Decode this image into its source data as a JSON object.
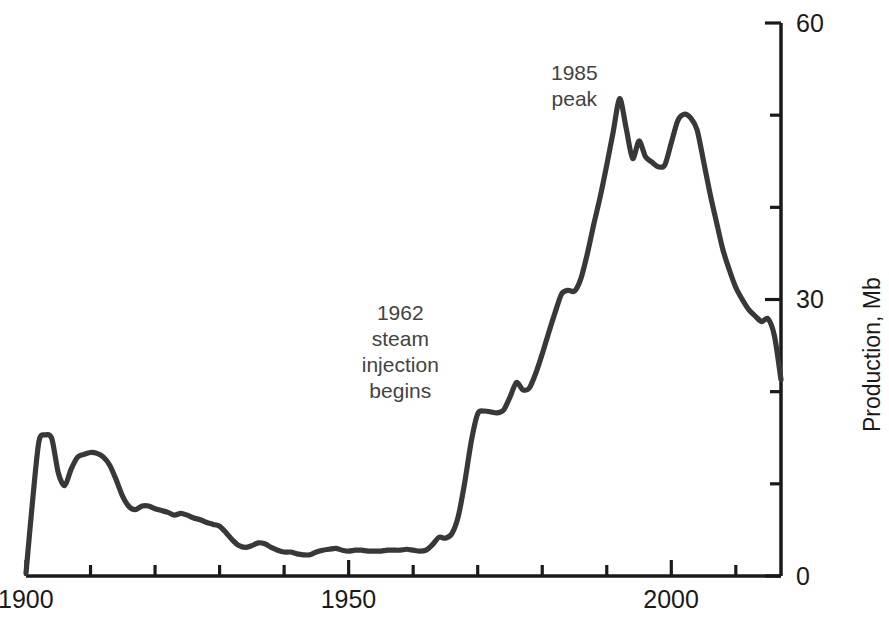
{
  "chart_data": {
    "type": "line",
    "title": "",
    "subtitle": "",
    "xlabel": "",
    "ylabel": "Production, Mb",
    "xlim": [
      1900,
      2017
    ],
    "ylim": [
      0,
      60
    ],
    "grid": false,
    "legend": "none",
    "line_color": "#383838",
    "x_ticks_major": [
      1900,
      1950,
      2000
    ],
    "x_ticks_minor": [
      1910,
      1920,
      1930,
      1940,
      1960,
      1970,
      1980,
      1990,
      2010
    ],
    "y_ticks_major": [
      0,
      30,
      60
    ],
    "y_ticks_minor": [
      10,
      20,
      40,
      50
    ],
    "x_tick_labels": [
      "1900",
      "1950",
      "2000"
    ],
    "y_tick_labels": [
      "0",
      "30",
      "60"
    ],
    "annotations": [
      {
        "name": "peak-1985",
        "lines": [
          "1985",
          "peak"
        ],
        "x_year": 1985,
        "y_value": 56
      },
      {
        "name": "steam-injection-1962",
        "lines": [
          "1962",
          "steam",
          "injection",
          "begins"
        ],
        "x_year": 1958,
        "y_value": 30
      }
    ],
    "x": [
      1900,
      1901,
      1902,
      1903,
      1904,
      1905,
      1906,
      1907,
      1908,
      1909,
      1910,
      1911,
      1912,
      1913,
      1914,
      1915,
      1916,
      1917,
      1918,
      1919,
      1920,
      1921,
      1922,
      1923,
      1924,
      1925,
      1926,
      1927,
      1928,
      1929,
      1930,
      1931,
      1932,
      1933,
      1934,
      1935,
      1936,
      1937,
      1938,
      1939,
      1940,
      1941,
      1942,
      1943,
      1944,
      1945,
      1946,
      1947,
      1948,
      1949,
      1950,
      1951,
      1952,
      1953,
      1954,
      1955,
      1956,
      1957,
      1958,
      1959,
      1960,
      1961,
      1962,
      1963,
      1964,
      1965,
      1966,
      1967,
      1968,
      1969,
      1970,
      1971,
      1972,
      1973,
      1974,
      1975,
      1976,
      1977,
      1978,
      1979,
      1980,
      1981,
      1982,
      1983,
      1984,
      1985,
      1986,
      1987,
      1988,
      1989,
      1990,
      1991,
      1992,
      1993,
      1994,
      1995,
      1996,
      1997,
      1998,
      1999,
      2000,
      2001,
      2002,
      2003,
      2004,
      2005,
      2006,
      2007,
      2008,
      2009,
      2010,
      2011,
      2012,
      2013,
      2014,
      2015,
      2016,
      2017
    ],
    "values": [
      0.3,
      8.0,
      14.6,
      15.3,
      14.9,
      11.2,
      9.8,
      11.6,
      12.9,
      13.2,
      13.4,
      13.3,
      12.9,
      12.0,
      10.4,
      8.6,
      7.5,
      7.2,
      7.6,
      7.6,
      7.3,
      7.1,
      6.9,
      6.6,
      6.8,
      6.6,
      6.3,
      6.1,
      5.8,
      5.6,
      5.4,
      4.7,
      3.9,
      3.3,
      3.1,
      3.3,
      3.6,
      3.5,
      3.1,
      2.8,
      2.6,
      2.6,
      2.4,
      2.3,
      2.3,
      2.6,
      2.8,
      2.9,
      3.0,
      2.8,
      2.7,
      2.8,
      2.8,
      2.7,
      2.7,
      2.7,
      2.8,
      2.8,
      2.8,
      2.9,
      2.8,
      2.7,
      2.8,
      3.4,
      4.2,
      4.1,
      4.6,
      6.5,
      10.2,
      14.6,
      17.6,
      17.9,
      17.8,
      17.7,
      18.0,
      19.4,
      21.0,
      20.2,
      20.4,
      22.0,
      24.1,
      26.4,
      28.6,
      30.6,
      31.0,
      30.9,
      32.3,
      35.0,
      38.2,
      41.2,
      44.6,
      48.2,
      51.8,
      48.6,
      45.3,
      47.2,
      45.5,
      44.9,
      44.4,
      44.6,
      47.0,
      49.4,
      50.1,
      49.7,
      48.4,
      45.0,
      41.5,
      38.4,
      35.4,
      33.2,
      31.3,
      30.0,
      28.9,
      28.2,
      27.6,
      27.9,
      26.0,
      21.3
    ]
  },
  "axis_title": {
    "y_right": "Production, Mb"
  }
}
